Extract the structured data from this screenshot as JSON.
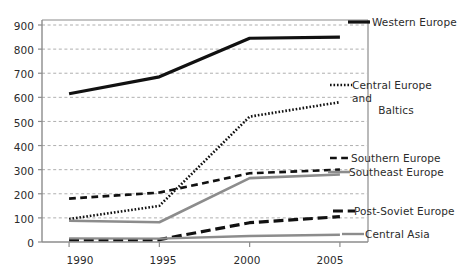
{
  "chart_data": {
    "type": "line",
    "title": "",
    "subtitle": "",
    "xlabel": "",
    "ylabel": "",
    "x": [
      1990,
      1995,
      2000,
      2005
    ],
    "categories": [
      "1990",
      "1995",
      "2000",
      "2005"
    ],
    "xlim": [
      1988.5,
      2006.5
    ],
    "ylim": [
      0,
      900
    ],
    "y_ticks": [
      0,
      100,
      200,
      300,
      400,
      500,
      600,
      700,
      800,
      900
    ],
    "x_ticks": [
      "1990",
      "1995",
      "2000",
      "2005"
    ],
    "grid": "horizontal-dashed",
    "legend_position": "right-inline",
    "series": [
      {
        "name": "Western Europe",
        "values": [
          615,
          685,
          845,
          850
        ],
        "color": "#111111",
        "style": "solid",
        "width": 3.2,
        "label_y": 22
      },
      {
        "name": "Central Europe and Baltics",
        "values": [
          95,
          150,
          520,
          580
        ],
        "color": "#111111",
        "style": "dotted",
        "width": 2.6,
        "label_y": 85
      },
      {
        "name": "Southern Europe",
        "values": [
          180,
          205,
          285,
          300
        ],
        "color": "#111111",
        "style": "dashed",
        "width": 2.6,
        "label_y": 158
      },
      {
        "name": "Southeast Europe",
        "values": [
          88,
          82,
          265,
          280
        ],
        "color": "#8c8c8c",
        "style": "solid",
        "width": 2.6,
        "label_y": 172
      },
      {
        "name": "Post-Soviet Europe",
        "values": [
          10,
          10,
          80,
          105
        ],
        "color": "#111111",
        "style": "long-dash",
        "width": 3.2,
        "label_y": 211
      },
      {
        "name": "Central Asia",
        "values": [
          15,
          14,
          25,
          30
        ],
        "color": "#8c8c8c",
        "style": "solid",
        "width": 2.4,
        "label_y": 234
      }
    ],
    "axis_color": "#8c8c8c",
    "grid_color": "#9a9a9a",
    "background": "#ffffff"
  },
  "y_axis": {
    "labels": [
      "900",
      "800",
      "700",
      "600",
      "500",
      "400",
      "300",
      "200",
      "100",
      "0"
    ]
  },
  "x_axis": {
    "labels": [
      "1990",
      "1995",
      "2000",
      "2005"
    ]
  },
  "legend": {
    "items": [
      {
        "label": "Western Europe",
        "line1": "Western Europe",
        "line2": ""
      },
      {
        "label": "Central Europe and Baltics",
        "line1": "Central Europe and",
        "line2": "Baltics"
      },
      {
        "label": "Southern Europe",
        "line1": "Southern Europe",
        "line2": ""
      },
      {
        "label": "Southeast Europe",
        "line1": "Southeast Europe",
        "line2": ""
      },
      {
        "label": "Post-Soviet Europe",
        "line1": "Post-Soviet Europe",
        "line2": ""
      },
      {
        "label": "Central Asia",
        "line1": "Central Asia",
        "line2": ""
      }
    ]
  }
}
